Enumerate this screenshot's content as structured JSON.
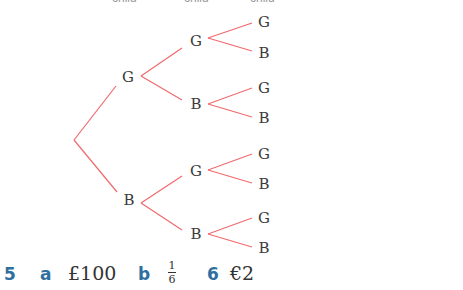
{
  "header_labels": [
    "child",
    "child",
    "child"
  ],
  "tree": {
    "branch_color": "#ef6a6e",
    "level1": [
      "G",
      "B"
    ],
    "level2": [
      "G",
      "B",
      "G",
      "B"
    ],
    "level3": [
      "G",
      "B",
      "G",
      "B",
      "G",
      "B",
      "G",
      "B"
    ]
  },
  "answers": {
    "q5_number": "5",
    "q5_a_label": "a",
    "q5_a_value": "£100",
    "q5_b_label": "b",
    "q5_b_numerator": "1",
    "q5_b_denominator": "6",
    "q6_number": "6",
    "q6_value": "€2",
    "label_color": "#2f6f9f"
  }
}
